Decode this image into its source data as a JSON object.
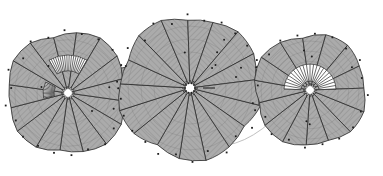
{
  "figure": {
    "title": "Spiral sector diagram",
    "background_color": "#ffffff",
    "fill_color": "#a8a8a8",
    "hatch_color": "#8e8e8e",
    "stroke_color": "#2b2b2b",
    "thin_arc_color": "#b9b9b9",
    "white_fan_color": "#ffffff",
    "white_fan_stripe_color": "#3a3a3a",
    "marker_color": "#1e1e1e",
    "canvas": {
      "width": 383,
      "height": 176
    }
  },
  "chart_data": {
    "type": "scatter",
    "title": "Spiral sector diagram",
    "xlabel": "",
    "ylabel": "",
    "grid": false,
    "legend": "none",
    "xlim": [
      0,
      383
    ],
    "ylim": [
      0,
      176
    ],
    "series": [
      {
        "name": "disc-left",
        "center": [
          68,
          93
        ],
        "radius": 62,
        "wedge_count": 16,
        "wedge_start_deg": 0,
        "wedge_sweep_deg": 360,
        "inner_hub_radius": 7,
        "hub_points": 12,
        "rim_marker_count": 22,
        "cell_dot_count": 6,
        "white_fan_regions": [
          {
            "angle_start_deg": 168,
            "angle_end_deg": 206,
            "r_inner": 14,
            "r_outer": 25,
            "stripes": 11
          },
          {
            "angle_start_deg": 240,
            "angle_end_deg": 300,
            "r_inner": 22,
            "r_outer": 38,
            "stripes": 17
          }
        ]
      },
      {
        "name": "disc-middle",
        "center": [
          190,
          88
        ],
        "radius": 72,
        "wedge_count": 17,
        "wedge_start_deg": 0,
        "wedge_sweep_deg": 360,
        "inner_hub_radius": 8,
        "hub_points": 12,
        "rim_marker_count": 26,
        "cell_dot_count": 7,
        "white_fan_regions": [
          {
            "angle_start_deg": 0,
            "angle_end_deg": 360,
            "r_inner": 13,
            "r_outer": 25,
            "stripes": 40
          }
        ]
      },
      {
        "name": "disc-right",
        "center": [
          310,
          90
        ],
        "radius": 57,
        "wedge_count": 15,
        "wedge_start_deg": 0,
        "wedge_sweep_deg": 360,
        "inner_hub_radius": 7,
        "hub_points": 12,
        "rim_marker_count": 20,
        "cell_dot_count": 5,
        "white_fan_regions": [
          {
            "angle_start_deg": 182,
            "angle_end_deg": 358,
            "r_inner": 9,
            "r_outer": 26,
            "stripes": 22
          }
        ]
      },
      {
        "name": "connector-band-left",
        "vertices": [
          [
            110,
            70
          ],
          [
            168,
            60
          ],
          [
            176,
            102
          ],
          [
            104,
            112
          ]
        ]
      },
      {
        "name": "connector-band-right",
        "vertices": [
          [
            243,
            72
          ],
          [
            296,
            66
          ],
          [
            300,
            104
          ],
          [
            238,
            108
          ]
        ]
      },
      {
        "name": "thin-bottom-arc",
        "from": [
          146,
          106
        ],
        "to": [
          289,
          103
        ],
        "sagitta": 62
      }
    ]
  }
}
